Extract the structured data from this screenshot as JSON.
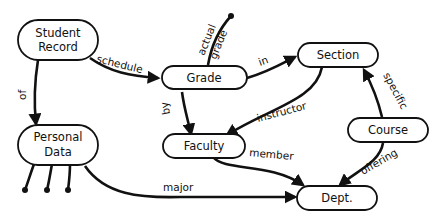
{
  "diagram": {
    "nodes": {
      "student_record": {
        "line1": "Student",
        "line2": "Record"
      },
      "personal_data": {
        "line1": "Personal",
        "line2": "Data"
      },
      "grade": {
        "label": "Grade"
      },
      "section": {
        "label": "Section"
      },
      "faculty": {
        "label": "Faculty"
      },
      "course": {
        "label": "Course"
      },
      "dept": {
        "label": "Dept."
      }
    },
    "edges": {
      "schedule": "schedule",
      "of": "of",
      "actual": "actual",
      "grade_attr": "grade",
      "in": "in",
      "by": "by",
      "instructor": "instructor",
      "specific": "specific",
      "member": "member",
      "offering": "offering",
      "major": "major"
    }
  }
}
